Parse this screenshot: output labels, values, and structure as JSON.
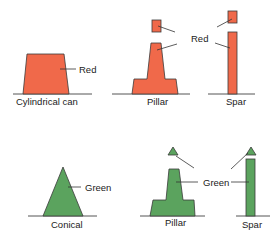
{
  "colors": {
    "red": "#f0694a",
    "green": "#5ba35e",
    "outline": "#3a3a3a",
    "ground": "#555555"
  },
  "red_row": {
    "color_label": "Red",
    "shapes": [
      {
        "name": "cylindrical-can",
        "label": "Cylindrical can"
      },
      {
        "name": "pillar",
        "label": "Pillar"
      },
      {
        "name": "spar",
        "label": "Spar"
      }
    ]
  },
  "green_row": {
    "color_label": "Green",
    "shapes": [
      {
        "name": "conical",
        "label": "Conical"
      },
      {
        "name": "pillar",
        "label": "Pillar"
      },
      {
        "name": "spar",
        "label": "Spar"
      }
    ]
  }
}
